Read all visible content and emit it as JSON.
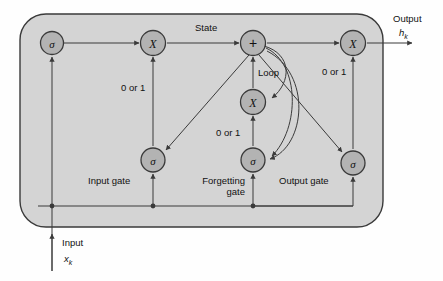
{
  "figure": {
    "cell_fill": "#d4d4d4",
    "node_fill": "#b3b3b3",
    "stroke": "#3a3a3a",
    "text_color": "#111111"
  },
  "nodes": [
    {
      "id": "input-sigma",
      "glyph": "σ",
      "kind": "sigma",
      "x": 52,
      "y": 43
    },
    {
      "id": "input-multiply",
      "glyph": "X",
      "kind": "mult",
      "x": 153,
      "y": 43
    },
    {
      "id": "state-adder",
      "glyph": "+",
      "kind": "add",
      "x": 253,
      "y": 43
    },
    {
      "id": "output-multiply",
      "glyph": "X",
      "kind": "mult",
      "x": 353,
      "y": 43
    },
    {
      "id": "loop-multiply",
      "glyph": "X",
      "kind": "mult",
      "x": 253,
      "y": 102
    },
    {
      "id": "input-gate-sigma",
      "glyph": "σ",
      "kind": "sigma",
      "x": 153,
      "y": 160
    },
    {
      "id": "forget-gate-sigma",
      "glyph": "σ",
      "kind": "sigma",
      "x": 253,
      "y": 160
    },
    {
      "id": "output-gate-sigma",
      "glyph": "σ",
      "kind": "sigma",
      "x": 353,
      "y": 163
    }
  ],
  "labels": {
    "state": "State",
    "loop": "Loop",
    "zero_or_one_input": "0 or 1",
    "zero_or_one_forget": "0 or 1",
    "zero_or_one_output": "0 or 1",
    "input_gate": "Input gate",
    "forgetting_gate_line1": "Forgetting",
    "forgetting_gate_line2": "gate",
    "output_gate": "Output gate",
    "output_title": "Output",
    "output_var": "h",
    "output_var_sub": "k",
    "input_title": "Input",
    "input_var": "x",
    "input_var_sub": "k"
  }
}
